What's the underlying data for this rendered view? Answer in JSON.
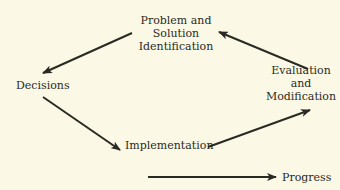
{
  "diagram": {
    "nodes": {
      "problem": {
        "line1": "Problem and",
        "line2": "Solution",
        "line3": "Identification"
      },
      "decisions": {
        "label": "Decisions"
      },
      "implementation": {
        "label": "Implementation"
      },
      "evaluation": {
        "line1": "Evaluation",
        "line2": "and",
        "line3": "Modification"
      }
    },
    "edges": [
      {
        "from": "Problem and Solution Identification",
        "to": "Decisions"
      },
      {
        "from": "Decisions",
        "to": "Implementation"
      },
      {
        "from": "Implementation",
        "to": "Evaluation and Modification"
      },
      {
        "from": "Evaluation and Modification",
        "to": "Problem and Solution Identification"
      }
    ],
    "legend": {
      "label": "Progress"
    },
    "colors": {
      "background": "#fbf9e6",
      "ink": "#2a2a24"
    }
  }
}
